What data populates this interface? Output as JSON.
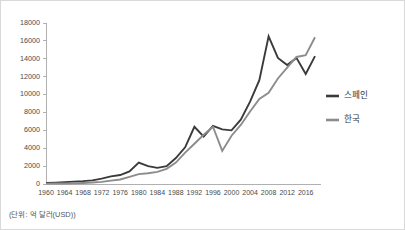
{
  "figure": {
    "footnote": "(단위: 억 달러(USD))",
    "border_color": "#d9d9d9",
    "background": "#ffffff"
  },
  "legend": {
    "position": "right",
    "entries": [
      {
        "label": "스페인",
        "color": "#3a3a3a"
      },
      {
        "label": "한국",
        "color": "#8c8c8c"
      }
    ]
  },
  "axes": {
    "y_ticks": [
      "0",
      "2000",
      "4000",
      "6000",
      "8000",
      "10000",
      "12000",
      "14000",
      "16000",
      "18000"
    ],
    "x_ticks": [
      "1960",
      "1964",
      "1968",
      "1972",
      "1976",
      "1980",
      "1984",
      "1988",
      "1992",
      "1996",
      "2000",
      "2004",
      "2008",
      "2012",
      "2016"
    ]
  },
  "chart_data": {
    "type": "line",
    "title": "",
    "xlabel": "",
    "ylabel": "",
    "xlim": [
      1960,
      2018
    ],
    "ylim": [
      0,
      18000
    ],
    "grid": false,
    "legend_position": "right",
    "annotation": "(단위: 억 달러(USD))",
    "y_tick_values": [
      0,
      2000,
      4000,
      6000,
      8000,
      10000,
      12000,
      14000,
      16000,
      18000
    ],
    "x_tick_values": [
      1960,
      1964,
      1968,
      1972,
      1976,
      1980,
      1984,
      1988,
      1992,
      1996,
      2000,
      2004,
      2008,
      2012,
      2016
    ],
    "x": [
      1960,
      1962,
      1964,
      1966,
      1968,
      1970,
      1972,
      1974,
      1976,
      1978,
      1980,
      1982,
      1984,
      1986,
      1988,
      1990,
      1992,
      1994,
      1996,
      1998,
      2000,
      2002,
      2004,
      2006,
      2008,
      2010,
      2012,
      2014,
      2016,
      2018
    ],
    "series": [
      {
        "name": "스페인",
        "color": "#3a3a3a",
        "values": [
          120,
          150,
          200,
          260,
          320,
          410,
          600,
          850,
          1000,
          1400,
          2400,
          2000,
          1800,
          2000,
          2900,
          4100,
          6400,
          5300,
          6500,
          6100,
          6000,
          7200,
          9200,
          11600,
          16500,
          14100,
          13300,
          14100,
          12300,
          14300
        ]
      },
      {
        "name": "한국",
        "color": "#8c8c8c",
        "values": [
          40,
          50,
          60,
          80,
          110,
          160,
          240,
          380,
          500,
          800,
          1100,
          1200,
          1350,
          1700,
          2400,
          3500,
          4500,
          5500,
          6400,
          3700,
          5400,
          6600,
          8100,
          9500,
          10200,
          11800,
          13000,
          14200,
          14400,
          16400
        ]
      }
    ]
  }
}
